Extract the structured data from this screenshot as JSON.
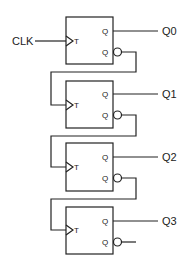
{
  "diagram": {
    "type": "ripple counter (T flip-flop chain)",
    "clock_label": "CLK",
    "flip_flops": [
      {
        "input_label": "T",
        "q_label": "Q",
        "qbar_label": "Q",
        "output_label": "Q0"
      },
      {
        "input_label": "T",
        "q_label": "Q",
        "qbar_label": "Q",
        "output_label": "Q1"
      },
      {
        "input_label": "T",
        "q_label": "Q",
        "qbar_label": "Q",
        "output_label": "Q2"
      },
      {
        "input_label": "T",
        "q_label": "Q",
        "qbar_label": "Q",
        "output_label": "Q3"
      }
    ],
    "colors": {
      "line": "#222222",
      "background": "#ffffff"
    }
  }
}
